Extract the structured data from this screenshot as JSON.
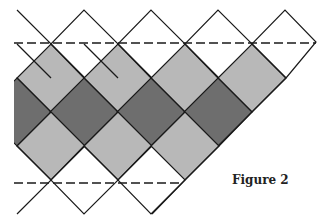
{
  "figure": {
    "caption": "Figure 2",
    "colors": {
      "light": "#b8b8b8",
      "dark": "#6e6e6e",
      "line": "#1a1a1a",
      "background": "#ffffff"
    },
    "grid": {
      "x0": 17,
      "step": 67,
      "y_levels": [
        10,
        44,
        78,
        112,
        146,
        180,
        214
      ]
    },
    "dashed_lines": [
      {
        "y": 43,
        "x1": 14,
        "x2": 316
      },
      {
        "y": 183,
        "x1": 14,
        "x2": 182
      }
    ]
  }
}
